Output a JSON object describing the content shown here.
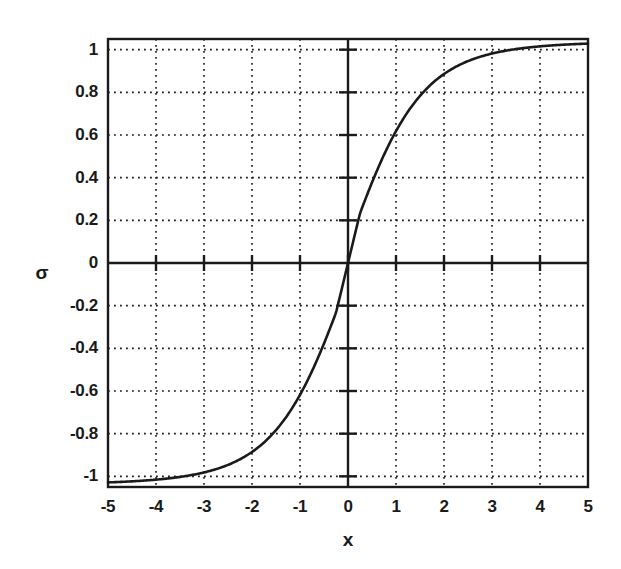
{
  "figure": {
    "background_color": "#ffffff",
    "ink_color": "#1a1a1a",
    "width": 621,
    "height": 569
  },
  "chart_data": {
    "type": "line",
    "title": "",
    "subtitle": "",
    "xlabel": "x",
    "ylabel": "σ",
    "xlim": [
      -5,
      5
    ],
    "ylim": [
      -1.05,
      1.05
    ],
    "grid": true,
    "grid_style": "dotted",
    "legend": null,
    "legend_position": "none",
    "xticks": [
      -5,
      -4,
      -3,
      -2,
      -1,
      0,
      1,
      2,
      3,
      4,
      5
    ],
    "xtick_labels": [
      "-5",
      "-4",
      "-3",
      "-2",
      "-1",
      "0",
      "1",
      "2",
      "3",
      "4",
      "5"
    ],
    "yticks": [
      -1,
      -0.8,
      -0.6,
      -0.4,
      -0.2,
      0,
      0.2,
      0.4,
      0.6,
      0.8,
      1
    ],
    "ytick_labels": [
      "-1",
      "-0.8",
      "-0.6",
      "-0.4",
      "-0.2",
      "0",
      "0.2",
      "0.4",
      "0.6",
      "0.8",
      "1"
    ],
    "series": [
      {
        "name": "sigma(x)",
        "description": "sigmoidal activation function, odd-symmetric, asymptotes at -1 and +1",
        "x": [
          -5.0,
          -4.75,
          -4.5,
          -4.25,
          -4.0,
          -3.75,
          -3.5,
          -3.25,
          -3.0,
          -2.75,
          -2.5,
          -2.25,
          -2.0,
          -1.75,
          -1.5,
          -1.25,
          -1.0,
          -0.75,
          -0.5,
          -0.25,
          0.0,
          0.25,
          0.5,
          0.75,
          1.0,
          1.25,
          1.5,
          1.75,
          2.0,
          2.25,
          2.5,
          2.75,
          3.0,
          3.25,
          3.5,
          3.75,
          4.0,
          4.25,
          4.5,
          4.75,
          5.0
        ],
        "y": [
          -1.027,
          -1.021,
          -1.013,
          -1.004,
          -0.993,
          -0.98,
          -0.965,
          -0.947,
          -0.927,
          -0.903,
          -0.875,
          -0.843,
          -0.806,
          -0.764,
          -0.716,
          -0.663,
          -0.604,
          -0.539,
          -0.469,
          -0.395,
          0.0,
          0.395,
          0.469,
          0.539,
          0.604,
          0.663,
          0.716,
          0.764,
          0.806,
          0.843,
          0.875,
          0.903,
          0.927,
          0.947,
          0.965,
          0.98,
          0.993,
          1.004,
          1.013,
          1.021,
          1.027
        ]
      }
    ],
    "key_points": [
      {
        "x": -5,
        "y": -1.03
      },
      {
        "x": -3,
        "y": -0.93
      },
      {
        "x": -2,
        "y": -0.81
      },
      {
        "x": -1,
        "y": -0.6
      },
      {
        "x": 0,
        "y": 0.0
      },
      {
        "x": 1,
        "y": 0.6
      },
      {
        "x": 2,
        "y": 0.81
      },
      {
        "x": 3,
        "y": 0.93
      },
      {
        "x": 5,
        "y": 1.03
      }
    ]
  }
}
